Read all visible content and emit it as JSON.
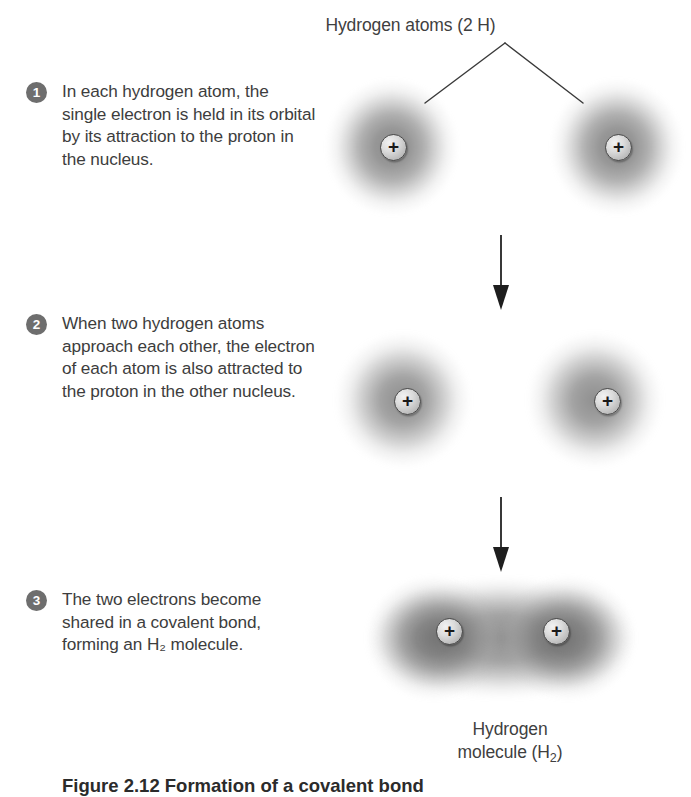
{
  "figure": {
    "title": "Hydrogen atoms (2 H)",
    "bottom_caption_visible_fragment": "Figure 2.12 Formation of a covalent bond",
    "molecule_label_line1": "Hydrogen",
    "molecule_label_line2_prefix": "molecule (H",
    "molecule_label_sub": "2",
    "molecule_label_line2_suffix": ")"
  },
  "steps": [
    {
      "number": "1",
      "text": "In each hydrogen atom, the single electron is held in its orbital by its attraction to the proton in the nucleus."
    },
    {
      "number": "2",
      "text": "When two hydrogen atoms approach each other, the electron of each atom is also attracted to the proton in the other nucleus."
    },
    {
      "number": "3",
      "text": "The two electrons become shared in a covalent bond, forming an H₂ molecule."
    }
  ],
  "atoms": {
    "proton_symbol": "+",
    "stage1": {
      "label": "two separate hydrogen atoms"
    },
    "stage2": {
      "label": "two hydrogen atoms approaching, distorted orbitals"
    },
    "stage3": {
      "label": "hydrogen molecule with shared electron cloud"
    }
  },
  "colors": {
    "badge_background": "#6e6e6e",
    "badge_text": "#ffffff",
    "body_text": "#3d3d3d",
    "cloud_gray": "#5a5a5a",
    "proton_outline": "#4a4a4a",
    "arrow": "#2f2f2f",
    "background": "#ffffff"
  },
  "connectors": {
    "leader_apex": "V-shaped leader from title to both atoms",
    "arrow_1_2": "downward arrow from stage 1 to stage 2",
    "arrow_2_3": "downward arrow from stage 2 to stage 3"
  }
}
